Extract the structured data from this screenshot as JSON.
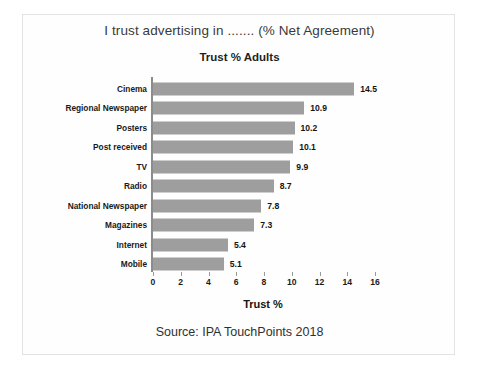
{
  "chart_data": {
    "type": "bar",
    "orientation": "horizontal",
    "title": "I trust advertising in ....... (% Net Agreement)",
    "subtitle": "Trust % Adults",
    "xlabel": "Trust %",
    "ylabel": "",
    "xlim": [
      0,
      16
    ],
    "xticks": [
      "0",
      "2",
      "4",
      "6",
      "8",
      "10",
      "12",
      "14",
      "16"
    ],
    "grid": false,
    "legend": false,
    "bar_color": "#9e9e9e",
    "categories": [
      "Cinema",
      "Regional Newspaper",
      "Posters",
      "Post received",
      "TV",
      "Radio",
      "National Newspaper",
      "Magazines",
      "Internet",
      "Mobile"
    ],
    "values": [
      14.5,
      10.9,
      10.2,
      10.1,
      9.9,
      8.7,
      7.8,
      7.3,
      5.4,
      5.1
    ],
    "data_labels": [
      "14.5",
      "10.9",
      "10.2",
      "10.1",
      "9.9",
      "8.7",
      "7.8",
      "7.3",
      "5.4",
      "5.1"
    ],
    "annotations": [
      "Source: IPA TouchPoints 2018"
    ]
  },
  "source_note": "Source: IPA TouchPoints 2018"
}
